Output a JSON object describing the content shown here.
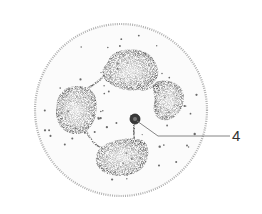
{
  "diagram": {
    "labels": [
      {
        "id": "4",
        "text": "4",
        "target": "small dark granule in center of cell"
      }
    ],
    "colors": {
      "membrane": "#a8a8a8",
      "nucleus": "#5a5a5a",
      "cytoplasm_dots": "#6a6a6a",
      "leader_line": "#777777",
      "label_text": "#333333"
    }
  }
}
